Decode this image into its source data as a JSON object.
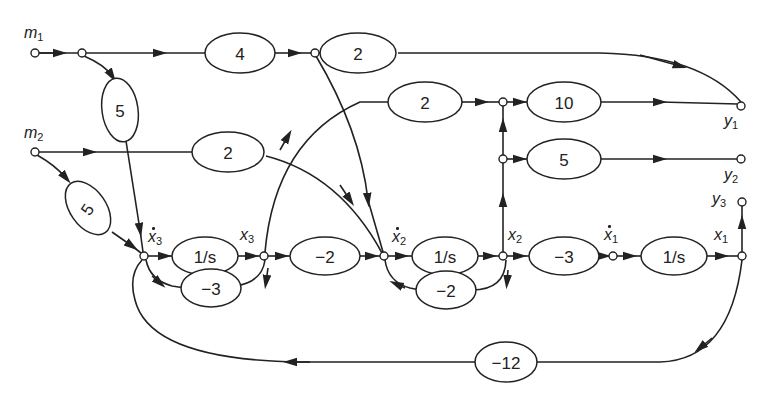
{
  "diagram": {
    "type": "signal-flow-graph",
    "inputs": [
      {
        "id": "m1",
        "label": "m",
        "sub": "1"
      },
      {
        "id": "m2",
        "label": "m",
        "sub": "2"
      }
    ],
    "outputs": [
      {
        "id": "y1",
        "label": "y",
        "sub": "1"
      },
      {
        "id": "y2",
        "label": "y",
        "sub": "2"
      },
      {
        "id": "y3",
        "label": "y",
        "sub": "3"
      }
    ],
    "states": [
      {
        "id": "x3dot",
        "label": "x",
        "sub": "3",
        "dot": true
      },
      {
        "id": "x3",
        "label": "x",
        "sub": "3",
        "dot": false
      },
      {
        "id": "x2dot",
        "label": "x",
        "sub": "2",
        "dot": true
      },
      {
        "id": "x2",
        "label": "x",
        "sub": "2",
        "dot": false
      },
      {
        "id": "x1dot",
        "label": "x",
        "sub": "1",
        "dot": true
      },
      {
        "id": "x1",
        "label": "x",
        "sub": "1",
        "dot": false
      }
    ],
    "gains": {
      "m1_to_y1_a": "4",
      "m1_to_y1_b": "2",
      "m1_to_x3dot": "5",
      "m2_to_x2dot": "2",
      "m2_to_x3dot": "5",
      "x3_to_y1": "2",
      "x2_to_y1": "10",
      "x2_to_y2": "5",
      "int3": "1/s",
      "fb3": "−3",
      "x3_to_x2dot": "−2",
      "int2": "1/s",
      "fb2": "−2",
      "x2_to_x1dot": "−3",
      "int1": "1/s",
      "x1_to_x3dot": "−12"
    }
  }
}
